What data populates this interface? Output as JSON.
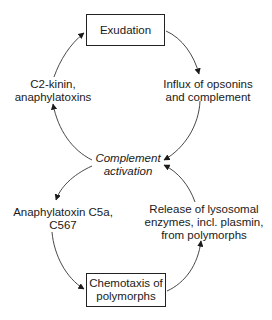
{
  "diagram": {
    "type": "cycle",
    "nodes": {
      "exudation": {
        "text": "Exudation",
        "boxed": true
      },
      "influx": {
        "text": "Influx of opsonins\nand complement",
        "boxed": false
      },
      "complement_activation": {
        "text": "Complement\nactivation",
        "boxed": false,
        "italic": true
      },
      "c2_kinin": {
        "text": "C2-kinin,\nanaphylatoxins",
        "boxed": false
      },
      "anaphylatoxin_c5a": {
        "text": "Anaphylatoxin C5a,\nC567",
        "boxed": false
      },
      "chemotaxis": {
        "text": "Chemotaxis of\npolymorphs",
        "boxed": true
      },
      "release": {
        "text": "Release of lysosomal\nenzymes, incl. plasmin,\nfrom polymorphs",
        "boxed": false
      }
    },
    "edges": [
      {
        "from": "exudation",
        "to": "influx"
      },
      {
        "from": "influx",
        "to": "complement_activation"
      },
      {
        "from": "complement_activation",
        "to": "c2_kinin"
      },
      {
        "from": "c2_kinin",
        "to": "exudation"
      },
      {
        "from": "complement_activation",
        "to": "anaphylatoxin_c5a"
      },
      {
        "from": "anaphylatoxin_c5a",
        "to": "chemotaxis"
      },
      {
        "from": "chemotaxis",
        "to": "release"
      },
      {
        "from": "release",
        "to": "complement_activation"
      }
    ]
  }
}
